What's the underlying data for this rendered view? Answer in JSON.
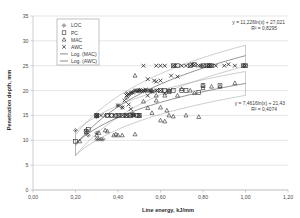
{
  "chart_data": {
    "type": "scatter",
    "title": "",
    "xlabel": "Line energy, kJ/mm",
    "ylabel": "Penetration depth, mm",
    "xlim": [
      0.0,
      1.2
    ],
    "ylim": [
      0,
      35
    ],
    "xticks": [
      "0,00",
      "0,20",
      "0,40",
      "0,60",
      "0,80",
      "1,00",
      "1,20"
    ],
    "xtick_values": [
      0.0,
      0.2,
      0.4,
      0.6,
      0.8,
      1.0,
      1.2
    ],
    "yticks": [
      "0",
      "5",
      "10",
      "15",
      "20",
      "25",
      "30",
      "35"
    ],
    "ytick_values": [
      0,
      5,
      10,
      15,
      20,
      25,
      30,
      35
    ],
    "grid": "horizontal",
    "legend_position": "top-left",
    "legend": [
      {
        "label": "LOC",
        "marker": "diamond"
      },
      {
        "label": "PC",
        "marker": "square"
      },
      {
        "label": "MAC",
        "marker": "triangle"
      },
      {
        "label": "AWC",
        "marker": "cross"
      },
      {
        "label": "Log. (MAC)",
        "marker": "line"
      },
      {
        "label": "Log. (AWC)",
        "marker": "line"
      }
    ],
    "annotations": [
      {
        "name": "awc-equation",
        "equation": "y = 11,226ln(x) + 27,021",
        "r2": "R² = 0,8295"
      },
      {
        "name": "mac-equation",
        "equation": "y = 7,4616ln(x) + 21,43",
        "r2": "R² = 0,4074"
      }
    ],
    "trendlines": [
      {
        "name": "Log. (AWC)",
        "form": "logarithmic",
        "a": 11.226,
        "b": 27.021,
        "r2": 0.8295,
        "xrange": [
          0.2,
          1.0
        ]
      },
      {
        "name": "Log. (MAC)",
        "form": "logarithmic",
        "a": 7.4616,
        "b": 21.43,
        "r2": 0.4074,
        "xrange": [
          0.2,
          1.0
        ]
      }
    ],
    "confidence_bands": [
      {
        "name": "AWC band",
        "offset": 2.1,
        "xrange": [
          0.2,
          1.0
        ]
      },
      {
        "name": "MAC band",
        "offset": 2.4,
        "xrange": [
          0.2,
          1.0
        ]
      }
    ],
    "series": [
      {
        "name": "LOC",
        "marker": "diamond",
        "points": [
          [
            0.2,
            12.0
          ],
          [
            0.25,
            11.5
          ],
          [
            0.25,
            12.0
          ],
          [
            0.26,
            11.0
          ],
          [
            0.3,
            15.0
          ],
          [
            0.3,
            14.8
          ],
          [
            0.3,
            11.5
          ],
          [
            0.3,
            10.2
          ],
          [
            0.31,
            10.2
          ],
          [
            0.32,
            10.2
          ],
          [
            0.33,
            10.2
          ],
          [
            0.4,
            17.0
          ],
          [
            0.42,
            16.6
          ],
          [
            0.44,
            18.5
          ],
          [
            0.45,
            19.0
          ],
          [
            0.46,
            19.5
          ],
          [
            0.47,
            19.7
          ],
          [
            0.48,
            20.0
          ],
          [
            0.49,
            20.0
          ],
          [
            0.5,
            20.1
          ],
          [
            0.51,
            20.0
          ],
          [
            0.52,
            19.9
          ],
          [
            0.53,
            20.0
          ],
          [
            0.55,
            20.0
          ],
          [
            0.56,
            19.8
          ],
          [
            0.58,
            20.0
          ],
          [
            0.44,
            19.4
          ]
        ]
      },
      {
        "name": "PC",
        "marker": "square",
        "points": [
          [
            0.2,
            9.8
          ],
          [
            0.25,
            11.8
          ],
          [
            0.26,
            12.2
          ],
          [
            0.3,
            15.0
          ],
          [
            0.3,
            14.9
          ],
          [
            0.35,
            15.0
          ],
          [
            0.37,
            15.0
          ],
          [
            0.39,
            14.9
          ],
          [
            0.4,
            15.0
          ],
          [
            0.42,
            15.0
          ],
          [
            0.44,
            15.0
          ],
          [
            0.46,
            15.0
          ],
          [
            0.47,
            15.1
          ],
          [
            0.49,
            15.0
          ],
          [
            0.5,
            15.0
          ],
          [
            0.6,
            20.0
          ],
          [
            0.62,
            20.0
          ],
          [
            0.64,
            19.8
          ],
          [
            0.66,
            20.0
          ],
          [
            0.7,
            20.0
          ],
          [
            0.72,
            20.0
          ],
          [
            0.78,
            19.6
          ],
          [
            0.8,
            21.0
          ],
          [
            0.88,
            21.0
          ],
          [
            1.0,
            25.0
          ],
          [
            0.99,
            25.0
          ],
          [
            0.66,
            25.0
          ],
          [
            0.68,
            25.0
          ],
          [
            0.74,
            25.0
          ],
          [
            0.76,
            25.2
          ],
          [
            0.8,
            25.0
          ],
          [
            0.82,
            25.0
          ],
          [
            0.83,
            25.0
          ],
          [
            0.84,
            25.0
          ]
        ]
      },
      {
        "name": "MAC",
        "marker": "triangle",
        "points": [
          [
            0.22,
            9.8
          ],
          [
            0.3,
            11.0
          ],
          [
            0.31,
            11.5
          ],
          [
            0.34,
            12.0
          ],
          [
            0.35,
            11.8
          ],
          [
            0.38,
            11.0
          ],
          [
            0.39,
            11.2
          ],
          [
            0.4,
            11.0
          ],
          [
            0.42,
            11.0
          ],
          [
            0.44,
            14.9
          ],
          [
            0.46,
            15.0
          ],
          [
            0.47,
            15.2
          ],
          [
            0.48,
            23.0
          ],
          [
            0.48,
            11.2
          ],
          [
            0.5,
            15.0
          ],
          [
            0.52,
            17.8
          ],
          [
            0.54,
            16.5
          ],
          [
            0.56,
            15.5
          ],
          [
            0.58,
            19.0
          ],
          [
            0.58,
            18.0
          ],
          [
            0.6,
            16.6
          ],
          [
            0.6,
            14.0
          ],
          [
            0.62,
            19.0
          ],
          [
            0.62,
            13.8
          ],
          [
            0.63,
            16.0
          ],
          [
            0.64,
            15.0
          ],
          [
            0.64,
            20.0
          ],
          [
            0.66,
            14.8
          ],
          [
            0.68,
            19.0
          ],
          [
            0.7,
            20.3
          ],
          [
            0.72,
            15.0
          ],
          [
            0.74,
            20.0
          ],
          [
            0.76,
            19.5
          ],
          [
            0.78,
            14.7
          ],
          [
            0.8,
            20.5
          ],
          [
            0.8,
            21.0
          ],
          [
            0.84,
            20.8
          ],
          [
            0.88,
            20.8
          ],
          [
            0.95,
            21.5
          ],
          [
            0.54,
            20.0
          ],
          [
            0.56,
            20.0
          ],
          [
            0.5,
            20.0
          ]
        ]
      },
      {
        "name": "AWC",
        "marker": "cross",
        "points": [
          [
            0.3,
            15.0
          ],
          [
            0.32,
            15.0
          ],
          [
            0.34,
            15.0
          ],
          [
            0.36,
            15.0
          ],
          [
            0.38,
            15.0
          ],
          [
            0.4,
            15.0
          ],
          [
            0.4,
            17.0
          ],
          [
            0.42,
            16.6
          ],
          [
            0.42,
            15.0
          ],
          [
            0.43,
            18.0
          ],
          [
            0.44,
            19.0
          ],
          [
            0.44,
            15.0
          ],
          [
            0.45,
            19.3
          ],
          [
            0.45,
            17.2
          ],
          [
            0.46,
            19.5
          ],
          [
            0.46,
            16.3
          ],
          [
            0.47,
            19.6
          ],
          [
            0.47,
            15.1
          ],
          [
            0.48,
            20.0
          ],
          [
            0.48,
            15.0
          ],
          [
            0.49,
            19.8
          ],
          [
            0.5,
            20.0
          ],
          [
            0.5,
            15.0
          ],
          [
            0.51,
            20.0
          ],
          [
            0.52,
            20.0
          ],
          [
            0.53,
            20.2
          ],
          [
            0.54,
            22.3
          ],
          [
            0.54,
            19.0
          ],
          [
            0.55,
            20.0
          ],
          [
            0.56,
            19.8
          ],
          [
            0.57,
            22.0
          ],
          [
            0.58,
            25.0
          ],
          [
            0.58,
            21.8
          ],
          [
            0.58,
            20.0
          ],
          [
            0.6,
            25.0
          ],
          [
            0.6,
            22.0
          ],
          [
            0.6,
            20.0
          ],
          [
            0.62,
            19.5
          ],
          [
            0.64,
            19.8
          ],
          [
            0.65,
            23.0
          ],
          [
            0.66,
            25.0
          ],
          [
            0.67,
            25.0
          ],
          [
            0.68,
            22.8
          ],
          [
            0.7,
            25.0
          ],
          [
            0.72,
            25.0
          ],
          [
            0.74,
            25.0
          ],
          [
            0.75,
            25.3
          ],
          [
            0.76,
            25.2
          ],
          [
            0.78,
            25.0
          ],
          [
            0.79,
            25.0
          ],
          [
            0.8,
            25.0
          ],
          [
            0.82,
            25.0
          ],
          [
            0.83,
            25.0
          ],
          [
            0.84,
            25.0
          ],
          [
            0.86,
            25.0
          ],
          [
            0.9,
            25.0
          ],
          [
            0.92,
            25.3
          ],
          [
            0.95,
            25.0
          ],
          [
            1.0,
            25.0
          ],
          [
            0.99,
            25.0
          ],
          [
            0.62,
            25.0
          ],
          [
            0.52,
            25.0
          ]
        ]
      }
    ]
  }
}
